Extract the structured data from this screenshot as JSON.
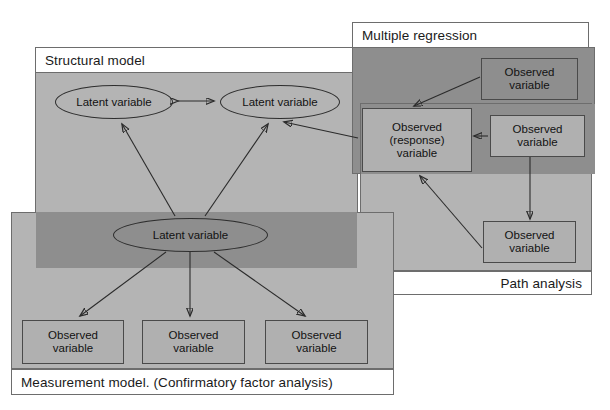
{
  "diagram": {
    "title_structural": "Structural model",
    "title_multiple_regression": "Multiple regression",
    "title_path_analysis": "Path analysis",
    "title_measurement": "Measurement model. (Confirmatory factor analysis)",
    "labels": {
      "latent": "Latent variable",
      "observed": "Observed\nvariable",
      "observed_response": "Observed\n(response)\nvariable"
    },
    "nodes": {
      "latent_left": "Latent variable",
      "latent_right": "Latent variable",
      "latent_center": "Latent variable",
      "obs_mm_1": "Observed variable",
      "obs_mm_2": "Observed variable",
      "obs_mm_3": "Observed variable",
      "obs_mr_top": "Observed variable",
      "obs_response": "Observed (response) variable",
      "obs_pa_right": "Observed variable",
      "obs_pa_bottom": "Observed variable"
    },
    "colors": {
      "panel_light": "#b4b4b4",
      "panel_dark": "#8e8e8e",
      "border": "#6d6d6d",
      "node_border": "#4a4a4a",
      "line": "#2b2b2b",
      "header_bg": "#ffffff",
      "text": "#1a1a1a"
    }
  }
}
